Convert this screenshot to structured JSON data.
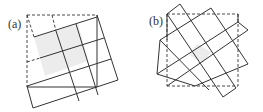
{
  "panels": [
    {
      "label": "(a)",
      "shaded_fill": "#ececec",
      "stroke": "#333333"
    },
    {
      "label": "(b)",
      "shaded_fill": "#ececec",
      "stroke": "#333333"
    }
  ]
}
